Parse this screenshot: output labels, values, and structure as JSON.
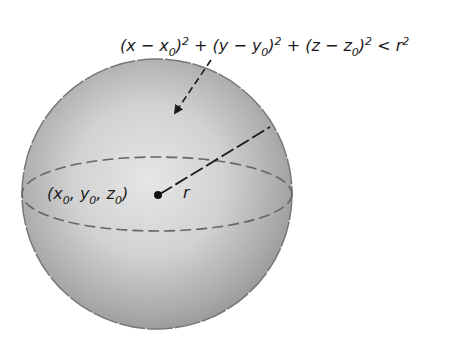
{
  "figure": {
    "type": "sphere-diagram",
    "equation": {
      "parts": [
        {
          "t": "(x − x",
          "sub": "0",
          "after": ")",
          "sup": "2"
        },
        {
          "t": " + (y − y",
          "sub": "0",
          "after": ")",
          "sup": "2"
        },
        {
          "t": " + (z − z",
          "sub": "0",
          "after": ")",
          "sup": "2"
        },
        {
          "t": " < r",
          "sup": "2"
        }
      ],
      "text": "(x − x0)² + (y − y0)² + (z − z0)² < r²"
    },
    "center_label": {
      "text": "(x0, y0, z0)",
      "x": "x",
      "y": "y",
      "z": "z",
      "sub": "0"
    },
    "radius_label": "r",
    "colors": {
      "sphere_light": "#e4e4e4",
      "sphere_dark": "#8a8a8a",
      "outline": "#6f6f6f",
      "line": "#1a1a1a",
      "text": "#1a1a1a"
    }
  }
}
